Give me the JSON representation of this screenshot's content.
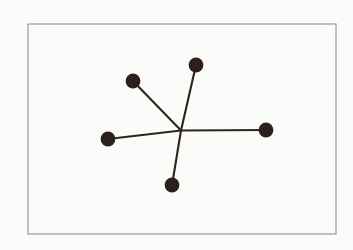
{
  "figure": {
    "canvas": {
      "width": 353,
      "height": 250,
      "background_color": "#fbfbf9",
      "outer_background_color": "#ffffff"
    },
    "frame": {
      "name": "image-border",
      "x": 28,
      "y": 24,
      "width": 308,
      "height": 210,
      "stroke_color": "#9a9a96",
      "stroke_width": 1.2
    },
    "style": {
      "node_color": "#2b201c",
      "node_radius": 7.4,
      "edge_color": "#2e241f",
      "edge_width": 2.1
    },
    "hub": {
      "name": "center-junction",
      "label": "center",
      "x": 181,
      "y": 130.5
    },
    "nodes": [
      {
        "id": "node-top",
        "label": "top",
        "x": 196,
        "y": 65
      },
      {
        "id": "node-upper-left",
        "label": "upper-left",
        "x": 133,
        "y": 81
      },
      {
        "id": "node-left",
        "label": "left",
        "x": 108,
        "y": 139
      },
      {
        "id": "node-right",
        "label": "right",
        "x": 266,
        "y": 130
      },
      {
        "id": "node-bottom",
        "label": "bottom",
        "x": 172,
        "y": 185
      }
    ],
    "edges": [
      {
        "id": "edge-top",
        "from": "center",
        "to": "top",
        "x1": 181,
        "y1": 130.5,
        "x2": 196,
        "y2": 65
      },
      {
        "id": "edge-upper-left",
        "from": "center",
        "to": "upper-left",
        "x1": 181,
        "y1": 130.5,
        "x2": 133,
        "y2": 81
      },
      {
        "id": "edge-left",
        "from": "center",
        "to": "left",
        "x1": 181,
        "y1": 130.5,
        "x2": 108,
        "y2": 139
      },
      {
        "id": "edge-right",
        "from": "center",
        "to": "right",
        "x1": 181,
        "y1": 130.5,
        "x2": 266,
        "y2": 130
      },
      {
        "id": "edge-bottom",
        "from": "center",
        "to": "bottom",
        "x1": 181,
        "y1": 130.5,
        "x2": 172,
        "y2": 185
      }
    ],
    "counts": {
      "node_count": 5,
      "edge_count": 5
    }
  }
}
